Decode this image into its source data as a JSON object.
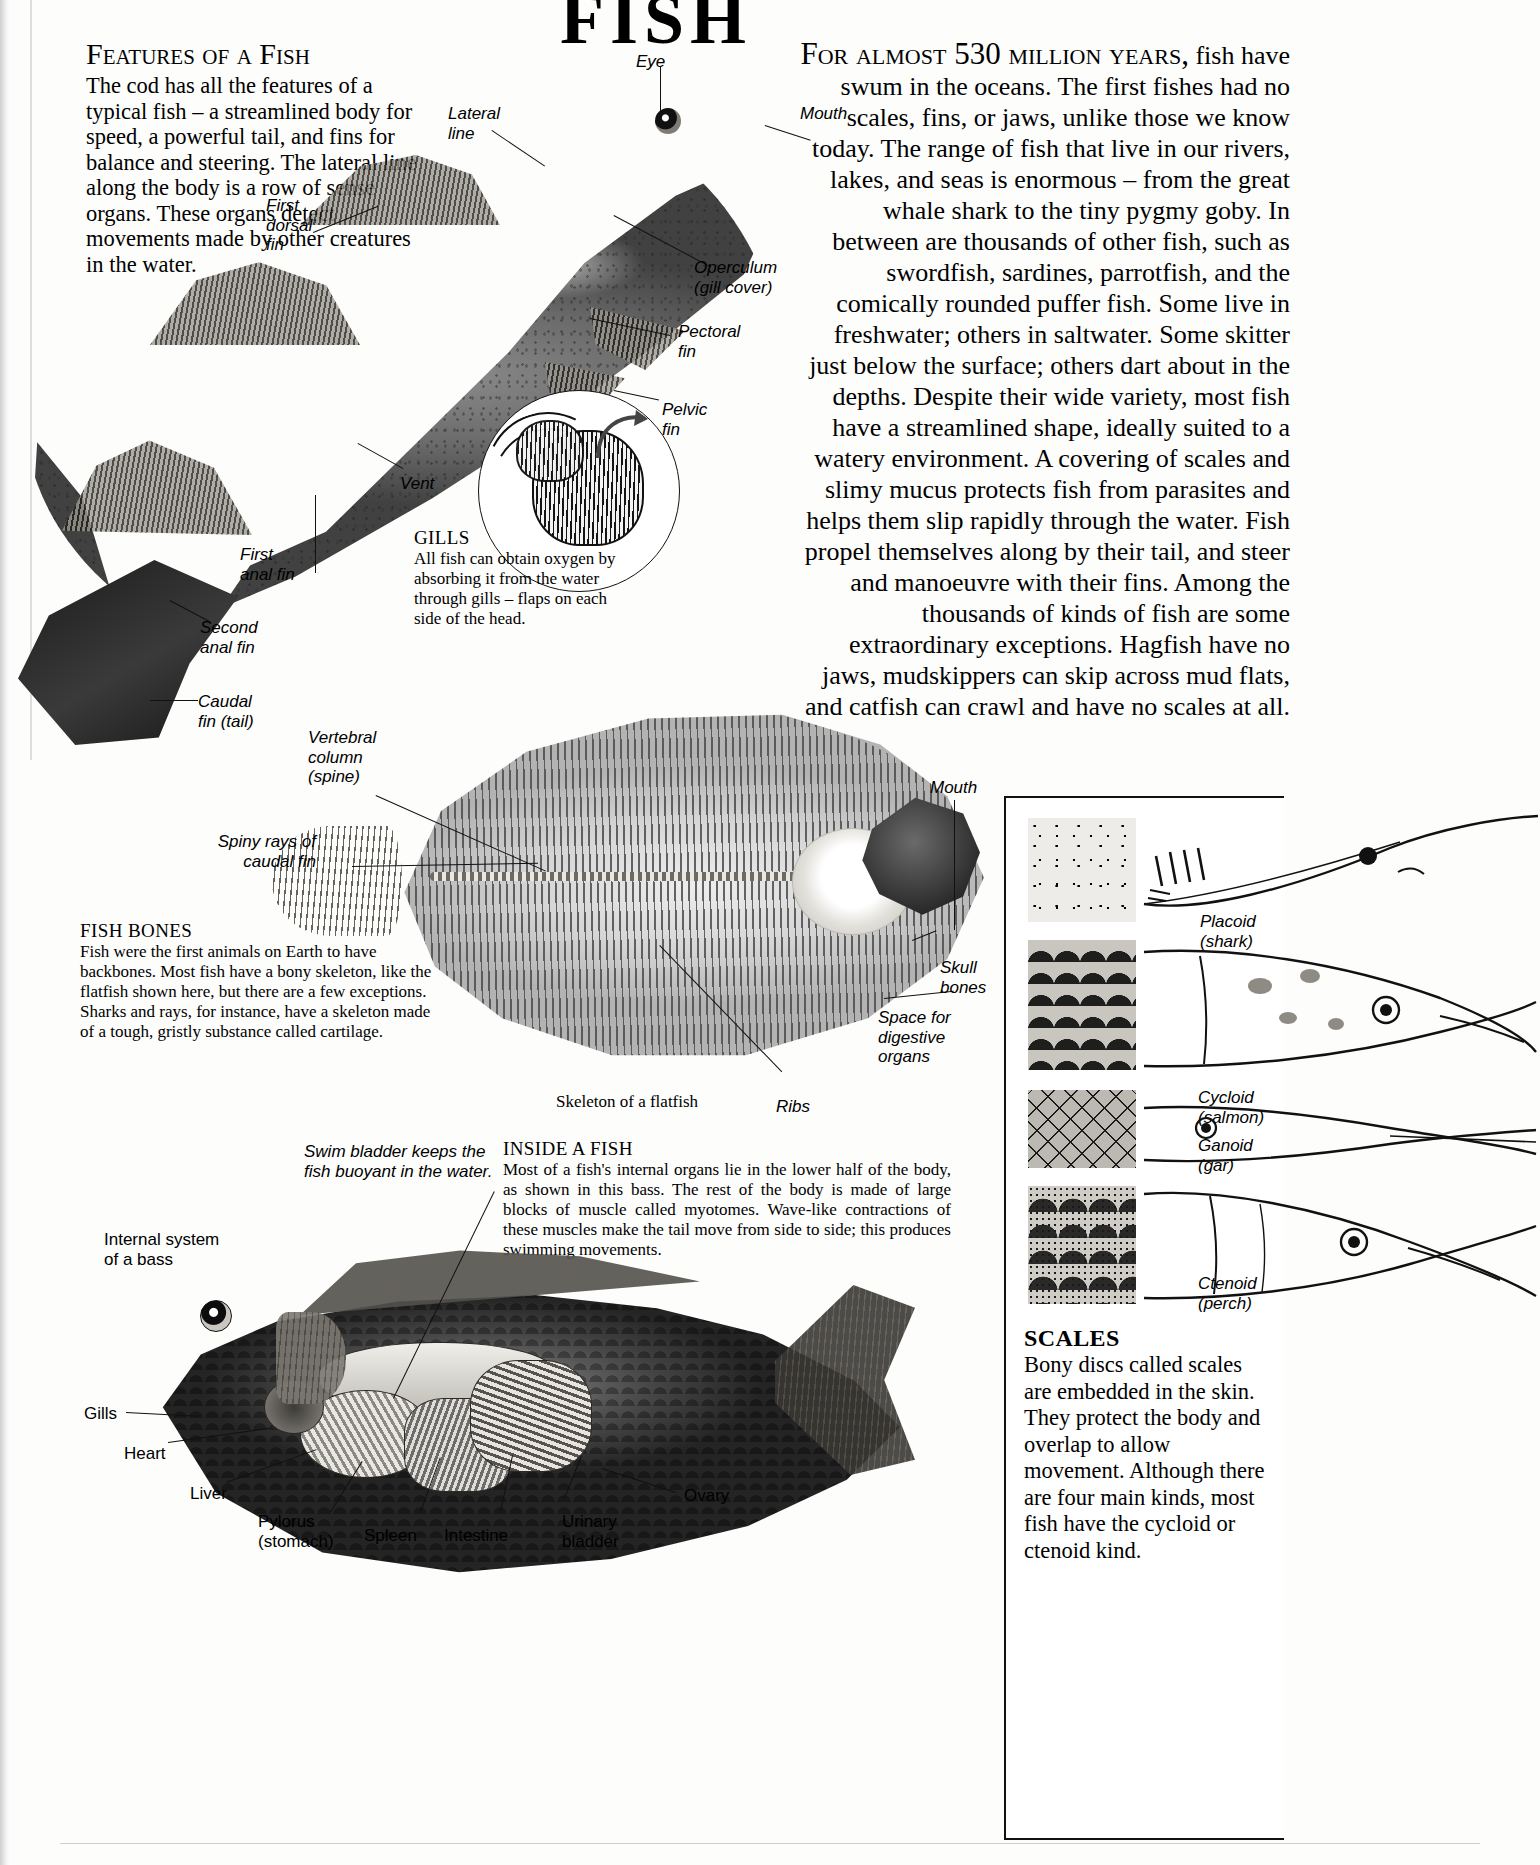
{
  "page": {
    "title": "FISH",
    "background": "#fdfdfc",
    "ink": "#000000"
  },
  "features": {
    "heading": "Features of a Fish",
    "body": "The cod has all the features of a typical fish – a streamlined body for speed, a powerful tail, and fins for balance and steering. The lateral line along the body is a row of sense organs. These organs detect movements made by other creatures in the water."
  },
  "intro": {
    "opening_small_caps": "For almost 530 million years,",
    "body": "fish have swum in the oceans. The first fishes had no scales, fins, or jaws, unlike those we know today. The range of fish that live in our rivers, lakes, and seas is enormous – from the great whale shark to the tiny pygmy goby. In between are thousands of other fish, such as swordfish, sardines, parrotfish, and the comically rounded puffer fish. Some live in freshwater; others in saltwater. Some skitter just below the surface; others dart about in the depths. Despite their wide variety, most fish have a streamlined shape, ideally suited to a watery environment. A covering of scales and slimy mucus protects fish from parasites and helps them slip rapidly through the water. Fish propel themselves along by their tail, and steer and manoeuvre with their fins. Among the thousands of kinds of fish are some extraordinary exceptions. Hagfish have no jaws, mudskippers can skip across mud flats, and catfish can crawl and have no scales at all."
  },
  "cod_labels": {
    "eye": "Eye",
    "lateral_line": "Lateral\nline",
    "mouth": "Mouth",
    "first_dorsal_fin": "First\ndorsal\nfin",
    "operculum": "Operculum\n(gill cover)",
    "pectoral_fin": "Pectoral\nfin",
    "pelvic_fin": "Pelvic\nfin",
    "vent": "Vent",
    "first_anal_fin": "First\nanal fin",
    "second_anal_fin": "Second\nanal fin",
    "caudal_fin": "Caudal\nfin (tail)"
  },
  "gills": {
    "heading": "GILLS",
    "body": "All fish can obtain oxygen by absorbing it from the water through gills – flaps on each side of the head."
  },
  "fish_bones": {
    "heading": "FISH BONES",
    "body": "Fish were the first animals on Earth to have backbones. Most fish have a bony skeleton, like the flatfish shown here, but there are a few exceptions. Sharks and rays, for instance, have a skeleton made of a tough, gristly substance called cartilage.",
    "caption": "Skeleton of a flatfish"
  },
  "flatfish_labels": {
    "vertebral_column": "Vertebral\ncolumn\n(spine)",
    "spiny_rays": "Spiny rays of\ncaudal fin",
    "mouth": "Mouth",
    "skull_bones": "Skull\nbones",
    "space_digestive": "Space for\ndigestive\norgans",
    "ribs": "Ribs"
  },
  "inside_a_fish": {
    "heading": "INSIDE A FISH",
    "body": "Most of a fish's internal organs lie in the lower half of the body, as shown in this bass. The rest of the body is made of large blocks of muscle called myotomes. Wave-like contractions of these muscles make the tail move from side to side; this produces swimming movements."
  },
  "bass_labels": {
    "swim_bladder": "Swim bladder keeps the fish buoyant in the water.",
    "internal_system": "Internal system\nof a bass",
    "gills": "Gills",
    "heart": "Heart",
    "liver": "Liver",
    "pylorus": "Pylorus\n(stomach)",
    "spleen": "Spleen",
    "intestine": "Intestine",
    "urinary_bladder": "Urinary\nbladder",
    "ovary": "Ovary"
  },
  "scales_panel": {
    "heading": "SCALES",
    "body": "Bony discs called scales are embedded in the skin. They protect the body and overlap to allow movement. Although there are four main kinds, most fish have the cycloid or ctenoid kind.",
    "types": [
      {
        "name": "Placoid",
        "animal": "(shark)"
      },
      {
        "name": "Cycloid",
        "animal": "(salmon)"
      },
      {
        "name": "Ganoid",
        "animal": "(gar)"
      },
      {
        "name": "Ctenoid",
        "animal": "(perch)"
      }
    ]
  }
}
